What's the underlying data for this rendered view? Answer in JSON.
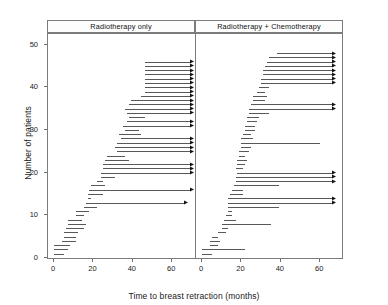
{
  "chart_data": {
    "type": "line",
    "subtype": "censored-interval-plot",
    "title": "",
    "xlabel": "Time to breast retraction (months)",
    "ylabel": "Number of patients",
    "xlim": [
      0,
      70
    ],
    "ylim": [
      0,
      52
    ],
    "xticks": [
      0,
      20,
      40,
      60
    ],
    "yticks": [
      0,
      10,
      20,
      30,
      40,
      50
    ],
    "grid": false,
    "legend": "none",
    "panels": [
      {
        "label": "Radiotherapy only",
        "n": 46,
        "xlim": [
          0,
          70
        ],
        "observations": [
          {
            "y": 1,
            "start": 0,
            "end": 5,
            "censored": false
          },
          {
            "y": 2,
            "start": 0,
            "end": 7,
            "censored": false
          },
          {
            "y": 3,
            "start": 0,
            "end": 8,
            "censored": false
          },
          {
            "y": 4,
            "start": 4,
            "end": 11,
            "censored": false
          },
          {
            "y": 5,
            "start": 5,
            "end": 11,
            "censored": false
          },
          {
            "y": 6,
            "start": 5,
            "end": 12,
            "censored": false
          },
          {
            "y": 7,
            "start": 6,
            "end": 15,
            "censored": false
          },
          {
            "y": 8,
            "start": 7,
            "end": 16,
            "censored": false
          },
          {
            "y": 9,
            "start": 7,
            "end": 14,
            "censored": false
          },
          {
            "y": 10,
            "start": 11,
            "end": 15,
            "censored": false
          },
          {
            "y": 11,
            "start": 11,
            "end": 18,
            "censored": false
          },
          {
            "y": 12,
            "start": 15,
            "end": 22,
            "censored": false
          },
          {
            "y": 13,
            "start": 16,
            "end": 68,
            "censored": true
          },
          {
            "y": 14,
            "start": 17,
            "end": 19,
            "censored": false
          },
          {
            "y": 15,
            "start": 17,
            "end": 25,
            "censored": false
          },
          {
            "y": 16,
            "start": 18,
            "end": 71,
            "censored": true
          },
          {
            "y": 17,
            "start": 19,
            "end": 26,
            "censored": false
          },
          {
            "y": 18,
            "start": 22,
            "end": 25,
            "censored": false
          },
          {
            "y": 19,
            "start": 24,
            "end": 31,
            "censored": false
          },
          {
            "y": 20,
            "start": 24,
            "end": 71,
            "censored": true
          },
          {
            "y": 21,
            "start": 25,
            "end": 71,
            "censored": true
          },
          {
            "y": 22,
            "start": 25,
            "end": 71,
            "censored": true
          },
          {
            "y": 23,
            "start": 26,
            "end": 38,
            "censored": false
          },
          {
            "y": 24,
            "start": 27,
            "end": 36,
            "censored": false
          },
          {
            "y": 25,
            "start": 32,
            "end": 71,
            "censored": true
          },
          {
            "y": 26,
            "start": 31,
            "end": 71,
            "censored": true
          },
          {
            "y": 27,
            "start": 32,
            "end": 71,
            "censored": true
          },
          {
            "y": 28,
            "start": 34,
            "end": 71,
            "censored": true
          },
          {
            "y": 29,
            "start": 33,
            "end": 44,
            "censored": false
          },
          {
            "y": 30,
            "start": 36,
            "end": 43,
            "censored": false
          },
          {
            "y": 31,
            "start": 35,
            "end": 71,
            "censored": true
          },
          {
            "y": 32,
            "start": 37,
            "end": 71,
            "censored": true
          },
          {
            "y": 33,
            "start": 38,
            "end": 46,
            "censored": false
          },
          {
            "y": 34,
            "start": 37,
            "end": 71,
            "censored": true
          },
          {
            "y": 35,
            "start": 36,
            "end": 71,
            "censored": true
          },
          {
            "y": 36,
            "start": 38,
            "end": 71,
            "censored": true
          },
          {
            "y": 37,
            "start": 39,
            "end": 71,
            "censored": true
          },
          {
            "y": 38,
            "start": 44,
            "end": 71,
            "censored": true
          },
          {
            "y": 39,
            "start": 46,
            "end": 71,
            "censored": true
          },
          {
            "y": 40,
            "start": 46,
            "end": 71,
            "censored": true
          },
          {
            "y": 41,
            "start": 46,
            "end": 71,
            "censored": true
          },
          {
            "y": 42,
            "start": 46,
            "end": 71,
            "censored": true
          },
          {
            "y": 43,
            "start": 46,
            "end": 71,
            "censored": true
          },
          {
            "y": 44,
            "start": 46,
            "end": 71,
            "censored": true
          },
          {
            "y": 45,
            "start": 46,
            "end": 71,
            "censored": true
          },
          {
            "y": 46,
            "start": 46,
            "end": 71,
            "censored": true
          }
        ]
      },
      {
        "label": "Radiotherapy + Chemotherapy",
        "n": 48,
        "xlim": [
          0,
          70
        ],
        "observations": [
          {
            "y": 1,
            "start": 0,
            "end": 5,
            "censored": false
          },
          {
            "y": 2,
            "start": 0,
            "end": 22,
            "censored": false
          },
          {
            "y": 3,
            "start": 4,
            "end": 8,
            "censored": false
          },
          {
            "y": 4,
            "start": 4,
            "end": 9,
            "censored": false
          },
          {
            "y": 5,
            "start": 5,
            "end": 8,
            "censored": false
          },
          {
            "y": 6,
            "start": 8,
            "end": 12,
            "censored": false
          },
          {
            "y": 7,
            "start": 10,
            "end": 13,
            "censored": false
          },
          {
            "y": 8,
            "start": 10,
            "end": 35,
            "censored": false
          },
          {
            "y": 9,
            "start": 11,
            "end": 17,
            "censored": false
          },
          {
            "y": 10,
            "start": 12,
            "end": 15,
            "censored": false
          },
          {
            "y": 11,
            "start": 13,
            "end": 15,
            "censored": false
          },
          {
            "y": 12,
            "start": 13,
            "end": 39,
            "censored": false
          },
          {
            "y": 13,
            "start": 13,
            "end": 68,
            "censored": true
          },
          {
            "y": 14,
            "start": 13,
            "end": 68,
            "censored": true
          },
          {
            "y": 15,
            "start": 14,
            "end": 21,
            "censored": false
          },
          {
            "y": 16,
            "start": 15,
            "end": 21,
            "censored": false
          },
          {
            "y": 17,
            "start": 16,
            "end": 39,
            "censored": false
          },
          {
            "y": 18,
            "start": 17,
            "end": 68,
            "censored": true
          },
          {
            "y": 19,
            "start": 17,
            "end": 68,
            "censored": true
          },
          {
            "y": 20,
            "start": 18,
            "end": 68,
            "censored": true
          },
          {
            "y": 21,
            "start": 17,
            "end": 21,
            "censored": false
          },
          {
            "y": 22,
            "start": 18,
            "end": 22,
            "censored": false
          },
          {
            "y": 23,
            "start": 18,
            "end": 23,
            "censored": false
          },
          {
            "y": 24,
            "start": 19,
            "end": 22,
            "censored": false
          },
          {
            "y": 25,
            "start": 19,
            "end": 24,
            "censored": false
          },
          {
            "y": 26,
            "start": 20,
            "end": 25,
            "censored": false
          },
          {
            "y": 27,
            "start": 20,
            "end": 60,
            "censored": false
          },
          {
            "y": 28,
            "start": 20,
            "end": 26,
            "censored": false
          },
          {
            "y": 29,
            "start": 21,
            "end": 25,
            "censored": false
          },
          {
            "y": 30,
            "start": 22,
            "end": 27,
            "censored": false
          },
          {
            "y": 31,
            "start": 22,
            "end": 27,
            "censored": false
          },
          {
            "y": 32,
            "start": 23,
            "end": 28,
            "censored": false
          },
          {
            "y": 33,
            "start": 23,
            "end": 29,
            "censored": false
          },
          {
            "y": 34,
            "start": 24,
            "end": 34,
            "censored": false
          },
          {
            "y": 35,
            "start": 24,
            "end": 68,
            "censored": true
          },
          {
            "y": 36,
            "start": 25,
            "end": 68,
            "censored": true
          },
          {
            "y": 37,
            "start": 26,
            "end": 32,
            "censored": false
          },
          {
            "y": 38,
            "start": 26,
            "end": 33,
            "censored": false
          },
          {
            "y": 39,
            "start": 28,
            "end": 32,
            "censored": false
          },
          {
            "y": 40,
            "start": 29,
            "end": 34,
            "censored": false
          },
          {
            "y": 41,
            "start": 30,
            "end": 68,
            "censored": true
          },
          {
            "y": 42,
            "start": 30,
            "end": 68,
            "censored": true
          },
          {
            "y": 43,
            "start": 31,
            "end": 68,
            "censored": true
          },
          {
            "y": 44,
            "start": 31,
            "end": 68,
            "censored": true
          },
          {
            "y": 45,
            "start": 32,
            "end": 68,
            "censored": true
          },
          {
            "y": 46,
            "start": 33,
            "end": 68,
            "censored": true
          },
          {
            "y": 47,
            "start": 34,
            "end": 68,
            "censored": true
          },
          {
            "y": 48,
            "start": 38,
            "end": 68,
            "censored": true
          }
        ]
      }
    ]
  },
  "axes": {
    "ylabel": "Number of patients",
    "xlabel": "Time to breast retraction (months)",
    "yticks": [
      "0",
      "10",
      "20",
      "30",
      "40",
      "50"
    ],
    "xticks": [
      "0",
      "20",
      "40",
      "60"
    ]
  },
  "colors": {
    "segment": "#585858",
    "arrow": "#141414",
    "frame": "#7b7b7b",
    "background": "#ffffff"
  }
}
